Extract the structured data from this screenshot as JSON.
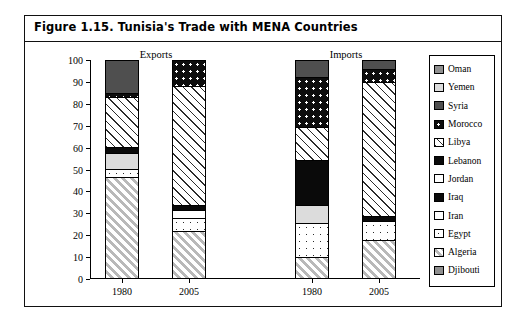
{
  "figure": {
    "title": "Figure 1.15.  Tunisia's Trade with MENA Countries"
  },
  "chart_data": {
    "type": "bar",
    "subtype": "stacked-100-percent",
    "title": "Figure 1.15.  Tunisia's Trade with MENA Countries",
    "xlabel": "",
    "ylabel": "Share in total MENA exports/imports (%)",
    "ylim": [
      0,
      100
    ],
    "ytick_labels": [
      "0",
      "10",
      "20",
      "30",
      "40",
      "50",
      "60",
      "70",
      "80",
      "90",
      "100"
    ],
    "ytick_values": [
      0,
      10,
      20,
      30,
      40,
      50,
      60,
      70,
      80,
      90,
      100
    ],
    "grid": false,
    "legend_position": "right",
    "groups": [
      {
        "label": "Exports",
        "categories": [
          "1980",
          "2005"
        ]
      },
      {
        "label": "Imports",
        "categories": [
          "1980",
          "2005"
        ]
      }
    ],
    "categories": [
      "1980",
      "2005",
      "1980",
      "2005"
    ],
    "column_names": [
      "Exports 1980",
      "Exports 2005",
      "Imports 1980",
      "Imports 2005"
    ],
    "series": [
      {
        "name": "Djibouti",
        "swatch": "solid-midgray",
        "values": [
          0,
          0,
          0,
          0
        ]
      },
      {
        "name": "Algeria",
        "swatch": "hatch",
        "values": [
          46,
          21,
          9,
          17
        ]
      },
      {
        "name": "Egypt",
        "swatch": "dots-sparse",
        "values": [
          4,
          6,
          16,
          9
        ]
      },
      {
        "name": "Iran",
        "swatch": "white",
        "values": [
          0,
          4,
          8,
          0
        ]
      },
      {
        "name": "Iraq",
        "swatch": "solid-black",
        "values": [
          8,
          2,
          0,
          0
        ]
      },
      {
        "name": "Jordan",
        "swatch": "white",
        "values": [
          0,
          0,
          0,
          0
        ]
      },
      {
        "name": "Lebanon",
        "swatch": "solid-black",
        "values": [
          2,
          0,
          21,
          2
        ]
      },
      {
        "name": "Libya",
        "swatch": "hatch-light",
        "values": [
          23,
          55,
          15,
          62
        ]
      },
      {
        "name": "Morocco",
        "swatch": "dots-black",
        "values": [
          2,
          12,
          23,
          6
        ]
      },
      {
        "name": "Syria",
        "swatch": "solid-darkgray",
        "values": [
          15,
          0,
          8,
          4
        ]
      },
      {
        "name": "Yemen",
        "swatch": "solid-lightgray",
        "values": [
          0,
          0,
          0,
          0
        ]
      },
      {
        "name": "Oman",
        "swatch": "solid-midgray",
        "values": [
          0,
          0,
          0,
          0
        ]
      }
    ],
    "stack_order_bottom_to_top": [
      "Algeria",
      "Egypt",
      "Iran",
      "Iraq",
      "Lebanon",
      "Libya",
      "Morocco",
      "Syria"
    ],
    "bars": [
      {
        "column": "Exports 1980",
        "group": "Exports",
        "category": "1980",
        "segments": [
          {
            "name": "Algeria",
            "value": 46,
            "swatch": "hatch"
          },
          {
            "name": "Egypt",
            "value": 4,
            "swatch": "dots-sparse"
          },
          {
            "name": "Yemen",
            "value": 7,
            "swatch": "solid-lightgray"
          },
          {
            "name": "Iraq",
            "value": 3,
            "swatch": "solid-black"
          },
          {
            "name": "Libya",
            "value": 23,
            "swatch": "hatch-light"
          },
          {
            "name": "Morocco",
            "value": 2,
            "swatch": "dots-black"
          },
          {
            "name": "Syria",
            "value": 15,
            "swatch": "solid-darkgray"
          }
        ]
      },
      {
        "column": "Exports 2005",
        "group": "Exports",
        "category": "2005",
        "segments": [
          {
            "name": "Algeria",
            "value": 21,
            "swatch": "hatch"
          },
          {
            "name": "Egypt",
            "value": 6,
            "swatch": "dots-sparse"
          },
          {
            "name": "Iran",
            "value": 4,
            "swatch": "white"
          },
          {
            "name": "Iraq",
            "value": 2,
            "swatch": "solid-black"
          },
          {
            "name": "Libya",
            "value": 55,
            "swatch": "hatch-light"
          },
          {
            "name": "Morocco",
            "value": 12,
            "swatch": "dots-black"
          }
        ]
      },
      {
        "column": "Imports 1980",
        "group": "Imports",
        "category": "1980",
        "segments": [
          {
            "name": "Algeria",
            "value": 9,
            "swatch": "hatch"
          },
          {
            "name": "Egypt",
            "value": 16,
            "swatch": "dots-sparse"
          },
          {
            "name": "Yemen",
            "value": 8,
            "swatch": "solid-lightgray"
          },
          {
            "name": "Lebanon",
            "value": 21,
            "swatch": "solid-black"
          },
          {
            "name": "Libya",
            "value": 15,
            "swatch": "hatch-light"
          },
          {
            "name": "Morocco",
            "value": 23,
            "swatch": "dots-black"
          },
          {
            "name": "Syria",
            "value": 8,
            "swatch": "solid-darkgray"
          }
        ]
      },
      {
        "column": "Imports 2005",
        "group": "Imports",
        "category": "2005",
        "segments": [
          {
            "name": "Algeria",
            "value": 17,
            "swatch": "hatch"
          },
          {
            "name": "Egypt",
            "value": 9,
            "swatch": "dots-sparse"
          },
          {
            "name": "Lebanon",
            "value": 2,
            "swatch": "solid-black"
          },
          {
            "name": "Libya",
            "value": 62,
            "swatch": "hatch-light"
          },
          {
            "name": "Morocco",
            "value": 6,
            "swatch": "dots-black"
          },
          {
            "name": "Syria",
            "value": 4,
            "swatch": "solid-darkgray"
          }
        ]
      }
    ]
  },
  "legend": {
    "items": [
      {
        "label": "Oman",
        "swatch": "solid-midgray"
      },
      {
        "label": "Yemen",
        "swatch": "solid-lightgray"
      },
      {
        "label": "Syria",
        "swatch": "solid-darkgray"
      },
      {
        "label": "Morocco",
        "swatch": "dots-black"
      },
      {
        "label": "Libya",
        "swatch": "hatch-light"
      },
      {
        "label": "Lebanon",
        "swatch": "solid-black"
      },
      {
        "label": "Jordan",
        "swatch": "white"
      },
      {
        "label": "Iraq",
        "swatch": "solid-black"
      },
      {
        "label": "Iran",
        "swatch": "white"
      },
      {
        "label": "Egypt",
        "swatch": "dots-sparse"
      },
      {
        "label": "Algeria",
        "swatch": "hatch"
      },
      {
        "label": "Djibouti",
        "swatch": "solid-midgray"
      }
    ]
  },
  "colors": {
    "frame": "#111111",
    "background": "#ffffff",
    "midgray": "#8f8f8f",
    "darkgray": "#4f4f4f",
    "lightgray": "#dcdcdc",
    "black": "#0a0a0a"
  }
}
